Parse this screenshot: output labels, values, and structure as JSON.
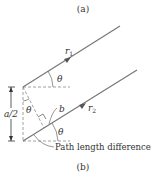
{
  "caption_top": "(a)",
  "caption_bottom": "(b)",
  "labels": {
    "ray1": "r",
    "ray1_sub": "1",
    "ray2": "r",
    "ray2_sub": "2",
    "theta": "θ",
    "half_spacing": "a/2",
    "segment": "b",
    "annotation": "Path length difference"
  },
  "colors": {
    "ray": "#777777",
    "arrow": "#555555",
    "dashed": "#888888",
    "text": "#333333"
  }
}
